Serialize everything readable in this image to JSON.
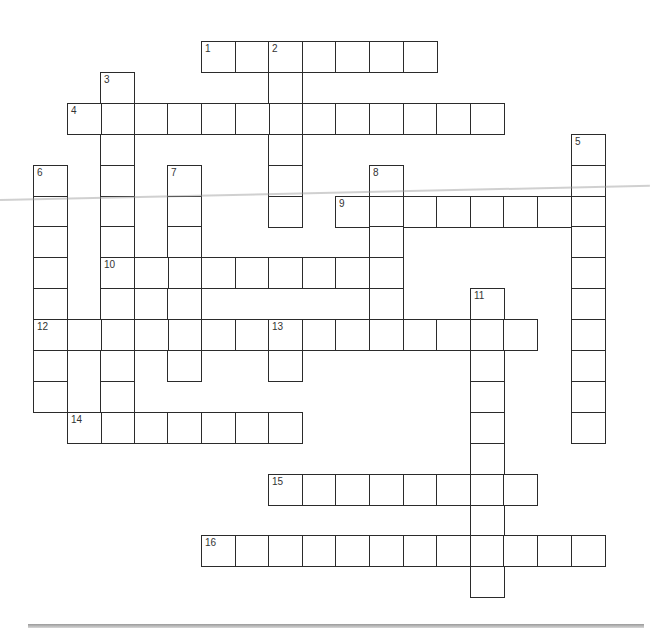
{
  "puzzle": {
    "grid": {
      "origin_x": 33,
      "origin_y": 41,
      "cell_w": 33.6,
      "cell_h": 30.9
    },
    "entries": [
      {
        "number": "1",
        "direction": "across",
        "row": 0,
        "col": 5,
        "length": 7
      },
      {
        "number": "2",
        "direction": "down",
        "row": 0,
        "col": 7,
        "length": 6
      },
      {
        "number": "3",
        "direction": "down",
        "row": 1,
        "col": 2,
        "length": 12
      },
      {
        "number": "4",
        "direction": "across",
        "row": 2,
        "col": 1,
        "length": 13
      },
      {
        "number": "5",
        "direction": "down",
        "row": 3,
        "col": 16,
        "length": 10
      },
      {
        "number": "6",
        "direction": "down",
        "row": 4,
        "col": 0,
        "length": 8
      },
      {
        "number": "7",
        "direction": "down",
        "row": 4,
        "col": 4,
        "length": 7
      },
      {
        "number": "8",
        "direction": "down",
        "row": 4,
        "col": 10,
        "length": 6
      },
      {
        "number": "9",
        "direction": "across",
        "row": 5,
        "col": 9,
        "length": 8
      },
      {
        "number": "10",
        "direction": "across",
        "row": 7,
        "col": 2,
        "length": 9
      },
      {
        "number": "11",
        "direction": "down",
        "row": 8,
        "col": 13,
        "length": 10
      },
      {
        "number": "12",
        "direction": "across",
        "row": 9,
        "col": 0,
        "length": 15
      },
      {
        "number": "13",
        "direction": "down",
        "row": 9,
        "col": 7,
        "length": 2
      },
      {
        "number": "14",
        "direction": "across",
        "row": 12,
        "col": 1,
        "length": 7
      },
      {
        "number": "15",
        "direction": "across",
        "row": 14,
        "col": 7,
        "length": 8
      },
      {
        "number": "16",
        "direction": "across",
        "row": 16,
        "col": 5,
        "length": 12
      }
    ]
  }
}
